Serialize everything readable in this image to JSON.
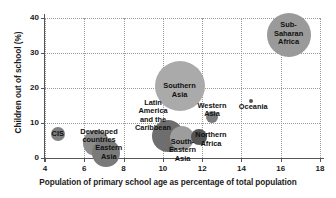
{
  "chart_data": {
    "type": "scatter",
    "title": "",
    "xlabel": "Population of primary school age as percentage of total population",
    "ylabel": "Children out of school (%)",
    "xlim": [
      4,
      18
    ],
    "ylim": [
      0,
      40
    ],
    "xticks": [
      4,
      6,
      8,
      10,
      12,
      14,
      16,
      18
    ],
    "yticks": [
      0,
      10,
      20,
      30,
      40
    ],
    "grid": true,
    "legend": "none",
    "note": "Bubble chart; bubble area is proportional to the number of children out of school in each region.",
    "points": [
      {
        "label": "CIS",
        "x": 4.65,
        "y": 6.8,
        "radius_px": 7,
        "color": "#808080",
        "label_x": 4.65,
        "label_y": 6.8
      },
      {
        "label": "Developed\ncountries",
        "x": 6.6,
        "y": 4.2,
        "radius_px": 13,
        "color": "#8c8c8c",
        "label_x": 6.75,
        "label_y": 6.4
      },
      {
        "label": "Eastern\nAsia",
        "x": 7.1,
        "y": 1.5,
        "radius_px": 14,
        "color": "#7a7a7a",
        "label_x": 7.25,
        "label_y": 1.6
      },
      {
        "label": "Latin\nAmerica\nand the\nCaribbean",
        "x": 10.25,
        "y": 6.4,
        "radius_px": 16,
        "color": "#6e6e6e",
        "label_x": 9.5,
        "label_y": 12.0
      },
      {
        "label": "Southern\nAsia",
        "x": 10.85,
        "y": 20.5,
        "radius_px": 25,
        "color": "#aaaaaa",
        "label_x": 10.85,
        "label_y": 19.3
      },
      {
        "label": "South-\nEastern\nAsia",
        "x": 10.95,
        "y": 5.6,
        "radius_px": 12,
        "color": "#9d9d9d",
        "label_x": 11.0,
        "label_y": 2.0
      },
      {
        "label": "Northern\nAfrica",
        "x": 11.85,
        "y": 5.9,
        "radius_px": 8,
        "color": "#555555",
        "label_x": 12.45,
        "label_y": 5.4
      },
      {
        "label": "Western\nAsia",
        "x": 12.5,
        "y": 11.8,
        "radius_px": 6,
        "color": "#7c7c7c",
        "label_x": 12.5,
        "label_y": 13.8
      },
      {
        "label": "Oceania",
        "x": 14.5,
        "y": 16.4,
        "radius_px": 2,
        "color": "#555555",
        "label_x": 14.6,
        "label_y": 14.6
      },
      {
        "label": "Sub-\nSaharan\nAfrica",
        "x": 16.4,
        "y": 35.2,
        "radius_px": 22,
        "color": "#9a9a9a",
        "label_x": 16.4,
        "label_y": 35.4
      }
    ]
  },
  "colors": {
    "background": "#ffffff",
    "axis": "#555555",
    "gridline": "#9a9a9a",
    "text": "#111111"
  }
}
